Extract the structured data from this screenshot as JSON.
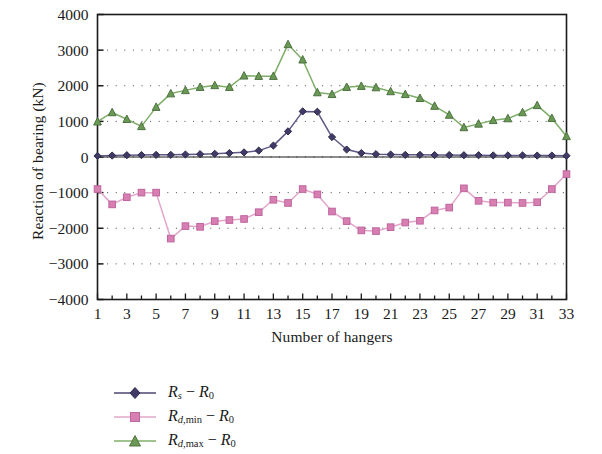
{
  "chart_data": {
    "type": "line",
    "title": "",
    "xlabel": "Number of hangers",
    "ylabel": "Reaction of bearing (kN)",
    "xlim": [
      1,
      33
    ],
    "ylim": [
      -4000,
      4000
    ],
    "ytick_labels": [
      "4000",
      "3000",
      "2000",
      "1000",
      "0",
      "−1000",
      "−2000",
      "−3000",
      "−4000"
    ],
    "ytick_values": [
      4000,
      3000,
      2000,
      1000,
      0,
      -1000,
      -2000,
      -3000,
      -4000
    ],
    "xtick_labels": [
      "1",
      "3",
      "5",
      "7",
      "9",
      "11",
      "13",
      "15",
      "17",
      "19",
      "21",
      "23",
      "25",
      "27",
      "29",
      "31",
      "33"
    ],
    "xtick_values": [
      1,
      3,
      5,
      7,
      9,
      11,
      13,
      15,
      17,
      19,
      21,
      23,
      25,
      27,
      29,
      31,
      33
    ],
    "x": [
      1,
      2,
      3,
      4,
      5,
      6,
      7,
      8,
      9,
      10,
      11,
      12,
      13,
      14,
      15,
      16,
      17,
      18,
      19,
      20,
      21,
      22,
      23,
      24,
      25,
      26,
      27,
      28,
      29,
      30,
      31,
      32,
      33
    ],
    "grid": "dotted",
    "grid_axis": "y",
    "legend_position": "below-left",
    "series": [
      {
        "name": "Rs_minus_R0",
        "label_parts": {
          "base": "R",
          "sub": "s",
          "op": "−",
          "base2": "R",
          "sub2": "0"
        },
        "color": "#4a4672",
        "marker": "diamond",
        "values": [
          30,
          40,
          50,
          55,
          60,
          60,
          70,
          80,
          90,
          110,
          130,
          180,
          320,
          720,
          1280,
          1270,
          560,
          210,
          110,
          80,
          70,
          60,
          60,
          55,
          55,
          50,
          50,
          45,
          45,
          45,
          40,
          40,
          35
        ]
      },
      {
        "name": "Rd_min_minus_R0",
        "label_parts": {
          "base": "R",
          "sub": "d,min",
          "op": "−",
          "base2": "R",
          "sub2": "0"
        },
        "color": "#d884b4",
        "marker": "square",
        "values": [
          -900,
          -1330,
          -1130,
          -1000,
          -1000,
          -2290,
          -1940,
          -1960,
          -1800,
          -1770,
          -1740,
          -1550,
          -1200,
          -1290,
          -900,
          -1050,
          -1530,
          -1800,
          -2060,
          -2080,
          -1970,
          -1840,
          -1790,
          -1500,
          -1420,
          -880,
          -1230,
          -1280,
          -1280,
          -1290,
          -1270,
          -900,
          -480
        ]
      },
      {
        "name": "Rd_max_minus_R0",
        "label_parts": {
          "base": "R",
          "sub": "d,max",
          "op": "−",
          "base2": "R",
          "sub2": "0"
        },
        "color": "#6a9855",
        "marker": "triangle",
        "values": [
          990,
          1250,
          1060,
          860,
          1400,
          1780,
          1870,
          1960,
          2010,
          1960,
          2280,
          2270,
          2270,
          3160,
          2730,
          1810,
          1760,
          1960,
          1990,
          1950,
          1840,
          1760,
          1650,
          1430,
          1180,
          830,
          930,
          1030,
          1080,
          1250,
          1450,
          1090,
          580
        ]
      }
    ]
  }
}
